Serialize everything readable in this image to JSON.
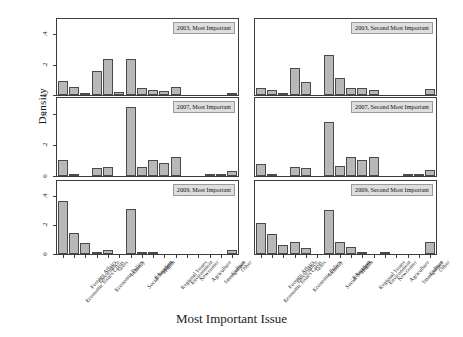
{
  "chart_data": {
    "type": "bar",
    "title": "",
    "xlabel": "Most Important Issue",
    "ylabel": "Density",
    "ylim": [
      0,
      0.5
    ],
    "yticks": [
      0,
      0.2,
      0.4
    ],
    "ytick_labels": [
      "0",
      ".2",
      ".4"
    ],
    "grid": false,
    "legend": null,
    "layout": "6 panels, 3 rows x 2 columns, shared axes",
    "categories": [
      "Economic Issues Crisis",
      "Foreign Affairs",
      "Governance",
      "Economic Policy",
      "Taxes",
      "Industry",
      "Social Services",
      "Education",
      "Health",
      "Regional Issues",
      "Environment",
      "Newcomer",
      "Agriculture",
      "Immigration",
      "Culture",
      "Other"
    ],
    "panels": [
      {
        "id": "p2003-most",
        "label": "2003, Most Important",
        "row": 0,
        "col": 0,
        "values": [
          0.09,
          0.05,
          0.01,
          0.155,
          0.235,
          0.02,
          0.24,
          0.045,
          0.03,
          0.025,
          0.05,
          0.0,
          0.0,
          0.0,
          0.0,
          0.015
        ]
      },
      {
        "id": "p2003-second",
        "label": "2003, Second Most Important",
        "row": 0,
        "col": 1,
        "values": [
          0.045,
          0.03,
          0.01,
          0.175,
          0.085,
          0.0,
          0.26,
          0.11,
          0.045,
          0.045,
          0.035,
          0.0,
          0.0,
          0.0,
          0.0,
          0.04
        ]
      },
      {
        "id": "p2007-most",
        "label": "2007, Most Important",
        "row": 1,
        "col": 0,
        "values": [
          0.105,
          0.005,
          0.0,
          0.05,
          0.055,
          0.0,
          0.44,
          0.06,
          0.105,
          0.085,
          0.12,
          0.0,
          0.0,
          0.015,
          0.005,
          0.03
        ]
      },
      {
        "id": "p2007-second",
        "label": "2007, Second Most Important",
        "row": 1,
        "col": 1,
        "values": [
          0.08,
          0.005,
          0.0,
          0.06,
          0.05,
          0.0,
          0.345,
          0.065,
          0.12,
          0.1,
          0.125,
          0.0,
          0.0,
          0.005,
          0.015,
          0.04
        ]
      },
      {
        "id": "p2009-most",
        "label": "2009, Most Important",
        "row": 2,
        "col": 0,
        "values": [
          0.36,
          0.145,
          0.075,
          0.015,
          0.025,
          0.0,
          0.305,
          0.015,
          0.005,
          0.0,
          0.0,
          0.0,
          0.0,
          0.0,
          0.0,
          0.025
        ]
      },
      {
        "id": "p2009-second",
        "label": "2009, Second Most Important",
        "row": 2,
        "col": 1,
        "values": [
          0.21,
          0.14,
          0.065,
          0.085,
          0.04,
          0.0,
          0.3,
          0.08,
          0.045,
          0.015,
          0.0,
          0.005,
          0.0,
          0.0,
          0.0,
          0.085
        ]
      }
    ]
  }
}
